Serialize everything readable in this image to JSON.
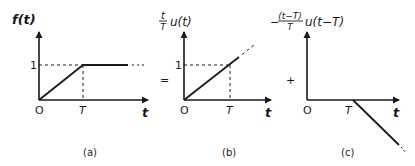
{
  "panels": [
    {
      "id": "a",
      "ylabel": "f(t)",
      "caption": "(a)",
      "origin": "O",
      "tick_T": "T",
      "tick_1": "1",
      "xlabel": "t"
    },
    {
      "id": "b",
      "ylabel_frac_num": "t",
      "ylabel_frac_den": "T",
      "ylabel_rest": "u(t)",
      "caption": "(b)",
      "origin": "O",
      "tick_T": "T",
      "tick_1": "1",
      "xlabel": "t"
    },
    {
      "id": "c",
      "ylabel_sign": "−",
      "ylabel_frac_num": "(t−T)",
      "ylabel_frac_den": "T",
      "ylabel_rest": "u(t−T)",
      "caption": "(c)",
      "origin": "O",
      "tick_T": "T",
      "xlabel": "t"
    }
  ],
  "operators": {
    "equals": "=",
    "plus": "+"
  }
}
